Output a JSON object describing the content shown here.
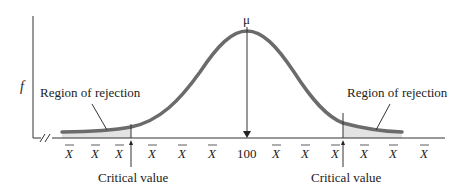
{
  "diagram": {
    "y_axis_label": "f",
    "mean_label": "μ",
    "center_value": "100",
    "x_tick_symbol": "X̄",
    "x_ticks": [
      "X̄",
      "X̄",
      "X̄",
      "X̄",
      "X̄",
      "X̄",
      "100",
      "X̄",
      "X̄",
      "X̄",
      "X̄",
      "X̄",
      "X̄"
    ],
    "left_region_label": "Region of rejection",
    "right_region_label": "Region of rejection",
    "left_critical_label": "Critical value",
    "right_critical_label": "Critical value",
    "colors": {
      "curve": "#6b6b6b",
      "shade": "#e3e3e3",
      "axis": "#333333",
      "text": "#222222"
    }
  }
}
